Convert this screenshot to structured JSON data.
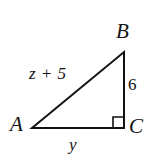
{
  "figure": {
    "kind": "geometry-diagram",
    "shape": "right-triangle",
    "background_color": "#ffffff",
    "stroke_color": "#111111",
    "stroke_width": 2,
    "vertices": [
      {
        "name": "A",
        "label": "A",
        "x": 32,
        "y": 128,
        "angle_mark": false
      },
      {
        "name": "B",
        "label": "B",
        "x": 124,
        "y": 52,
        "angle_mark": false
      },
      {
        "name": "C",
        "label": "C",
        "x": 124,
        "y": 128,
        "angle_mark": true
      }
    ],
    "right_angle": {
      "at_vertex": "C",
      "marker": "square",
      "size": 11
    },
    "sides": [
      {
        "name": "AB",
        "role": "hypotenuse",
        "label": "z + 5"
      },
      {
        "name": "BC",
        "role": "vertical-leg",
        "label": "6"
      },
      {
        "name": "AC",
        "role": "horizontal-leg",
        "label": "y"
      }
    ],
    "labels": {
      "vertex_a": "A",
      "vertex_b": "B",
      "vertex_c": "C",
      "hypotenuse": "z + 5",
      "vertical_leg": "6",
      "horizontal_leg": "y"
    }
  }
}
